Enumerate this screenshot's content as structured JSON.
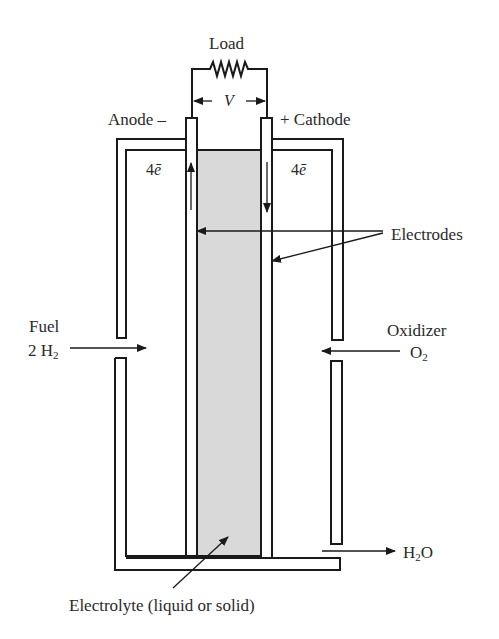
{
  "diagram": {
    "type": "fuel-cell-schematic",
    "labels": {
      "load": "Load",
      "voltage": "V",
      "anode": "Anode –",
      "cathode": "+ Cathode",
      "electrons_left_num": "4",
      "electrons_left_sym": "ē",
      "electrons_right_num": "4",
      "electrons_right_sym": "ē",
      "electrodes": "Electrodes",
      "fuel": "Fuel",
      "fuel_formula_prefix": "2 H",
      "fuel_formula_sub": "2",
      "oxidizer": "Oxidizer",
      "oxidizer_formula_prefix": "O",
      "oxidizer_formula_sub": "2",
      "product_prefix": "H",
      "product_sub": "2",
      "product_suffix": "O",
      "electrolyte": "Electrolyte (liquid or solid)"
    },
    "colors": {
      "line": "#1a1a1a",
      "electrolyte_fill": "#d9d9d9",
      "background": "#ffffff"
    }
  }
}
